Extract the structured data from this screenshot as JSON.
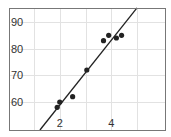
{
  "chart_data": {
    "type": "scatter",
    "title": "",
    "xlabel": "",
    "ylabel": "",
    "xlim": [
      0.0,
      5.1
    ],
    "ylim": [
      49.5,
      95.5
    ],
    "grid": true,
    "legend": null,
    "x_ticks": [
      1,
      2,
      3,
      4,
      5
    ],
    "x_tick_labels": [
      "",
      "2",
      "",
      "4",
      ""
    ],
    "y_ticks": [
      60,
      70,
      80,
      90
    ],
    "y_tick_labels": [
      "60",
      "70",
      "80",
      "90"
    ],
    "series": [
      {
        "name": "data",
        "kind": "points",
        "x": [
          1.9,
          2.0,
          2.5,
          3.05,
          3.7,
          3.9,
          4.2,
          4.4
        ],
        "y": [
          58,
          60,
          62,
          72,
          83,
          85,
          84,
          85
        ]
      },
      {
        "name": "fit",
        "kind": "line",
        "x": [
          1.23,
          5.0
        ],
        "y": [
          49.5,
          95.3
        ]
      }
    ],
    "colors": {
      "points": "#222222",
      "line": "#222222",
      "grid": "#e2e2e2",
      "frame": "#777777"
    }
  }
}
